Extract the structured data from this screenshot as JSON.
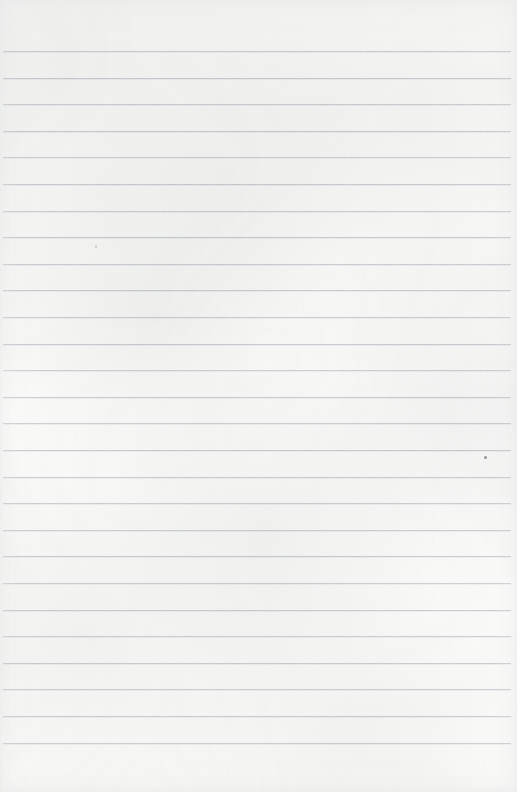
{
  "document": {
    "kind": "scanned-lined-paper",
    "description": "Blank ruled notebook page scan",
    "text_content": "",
    "page_width": 517,
    "page_height": 792
  },
  "paper": {
    "background_color": "#fbfbfa",
    "edge_shade_color": "#e1e3e2"
  },
  "ruling": {
    "line_color": "#c9ced3",
    "line_thickness": 1,
    "line_spacing": 26.6,
    "first_line_y": 51,
    "last_line_y": 743,
    "line_start_x": 3,
    "line_end_x": 511,
    "line_count": 27,
    "lines": [
      {
        "y": 51,
        "x1": 3,
        "x2": 511,
        "opacity": 0.9
      },
      {
        "y": 78,
        "x1": 3,
        "x2": 511,
        "opacity": 0.95
      },
      {
        "y": 104,
        "x1": 3,
        "x2": 511,
        "opacity": 0.9
      },
      {
        "y": 131,
        "x1": 3,
        "x2": 511,
        "opacity": 0.95
      },
      {
        "y": 157,
        "x1": 3,
        "x2": 511,
        "opacity": 0.88
      },
      {
        "y": 184,
        "x1": 3,
        "x2": 511,
        "opacity": 0.93
      },
      {
        "y": 211,
        "x1": 3,
        "x2": 511,
        "opacity": 0.9
      },
      {
        "y": 237,
        "x1": 3,
        "x2": 511,
        "opacity": 0.95
      },
      {
        "y": 264,
        "x1": 3,
        "x2": 511,
        "opacity": 0.9
      },
      {
        "y": 290,
        "x1": 3,
        "x2": 511,
        "opacity": 0.93
      },
      {
        "y": 317,
        "x1": 3,
        "x2": 511,
        "opacity": 0.9
      },
      {
        "y": 344,
        "x1": 3,
        "x2": 511,
        "opacity": 0.95
      },
      {
        "y": 370,
        "x1": 3,
        "x2": 511,
        "opacity": 0.88
      },
      {
        "y": 397,
        "x1": 3,
        "x2": 511,
        "opacity": 0.93
      },
      {
        "y": 423,
        "x1": 3,
        "x2": 511,
        "opacity": 0.9
      },
      {
        "y": 450,
        "x1": 3,
        "x2": 511,
        "opacity": 0.95
      },
      {
        "y": 477,
        "x1": 3,
        "x2": 511,
        "opacity": 0.9
      },
      {
        "y": 503,
        "x1": 3,
        "x2": 511,
        "opacity": 0.93
      },
      {
        "y": 530,
        "x1": 3,
        "x2": 511,
        "opacity": 0.9
      },
      {
        "y": 556,
        "x1": 3,
        "x2": 511,
        "opacity": 0.95
      },
      {
        "y": 583,
        "x1": 3,
        "x2": 511,
        "opacity": 0.88
      },
      {
        "y": 610,
        "x1": 3,
        "x2": 511,
        "opacity": 0.93
      },
      {
        "y": 636,
        "x1": 3,
        "x2": 511,
        "opacity": 0.9
      },
      {
        "y": 663,
        "x1": 3,
        "x2": 511,
        "opacity": 0.95
      },
      {
        "y": 689,
        "x1": 3,
        "x2": 511,
        "opacity": 0.9
      },
      {
        "y": 716,
        "x1": 3,
        "x2": 511,
        "opacity": 0.93
      },
      {
        "y": 743,
        "x1": 3,
        "x2": 511,
        "opacity": 0.9
      }
    ]
  },
  "marks": [
    {
      "name": "ink-speck-right",
      "x": 484,
      "y": 456,
      "w": 3,
      "h": 3,
      "faint": false
    },
    {
      "name": "ink-speck-left",
      "x": 95,
      "y": 245,
      "w": 2,
      "h": 3,
      "faint": true
    }
  ]
}
